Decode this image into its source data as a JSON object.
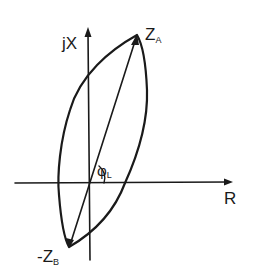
{
  "diagram": {
    "type": "complex-impedance-plane",
    "colors": {
      "ink": "#1a1a1a",
      "background": "#ffffff"
    },
    "axes": {
      "vertical": {
        "label_main": "jX",
        "label_sub": ""
      },
      "horizontal": {
        "label_main": "R",
        "label_sub": ""
      }
    },
    "points": [
      {
        "id": "ZA",
        "label_prefix": "",
        "label_main": "Z",
        "label_sub": "A"
      },
      {
        "id": "ZB",
        "label_prefix": "-",
        "label_main": "Z",
        "label_sub": "B"
      }
    ],
    "angle": {
      "label_main": "φ",
      "label_sub": "L"
    },
    "elements": [
      "vertical axis jX with arrow",
      "horizontal axis R with arrow",
      "lens-shaped locus curve between -Z_B and Z_A",
      "line vector from -Z_B to Z_A",
      "angle arc φ_L between R axis and line"
    ]
  }
}
